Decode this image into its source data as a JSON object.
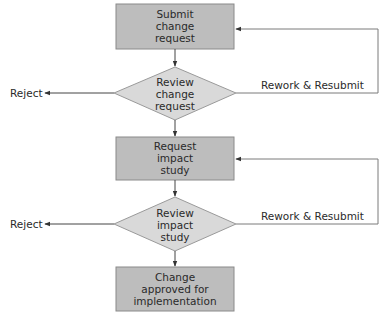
{
  "colors": {
    "process_fill": "#bdbdbd",
    "process_stroke": "#8a8a8a",
    "decision_fill": "#d9d9d9",
    "decision_stroke": "#9a9a9a",
    "line": "#444444",
    "feedback_line": "#7a7a7a",
    "text": "#2a2a2a"
  },
  "nodes": [
    {
      "id": "submit",
      "type": "process",
      "lines": [
        "Submit",
        "change",
        "request"
      ]
    },
    {
      "id": "review_change",
      "type": "decision",
      "lines": [
        "Review",
        "change",
        "request"
      ]
    },
    {
      "id": "impact",
      "type": "process",
      "lines": [
        "Request",
        "impact",
        "study"
      ]
    },
    {
      "id": "review_impact",
      "type": "decision",
      "lines": [
        "Review",
        "impact",
        "study"
      ]
    },
    {
      "id": "approved",
      "type": "process",
      "lines": [
        "Change",
        "approved for",
        "implementation"
      ]
    }
  ],
  "edges": {
    "reject_1": "Reject",
    "rework_1": "Rework & Resubmit",
    "reject_2": "Reject",
    "rework_2": "Rework & Resubmit"
  }
}
